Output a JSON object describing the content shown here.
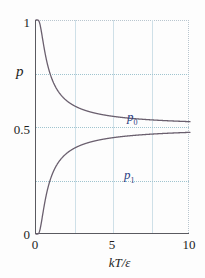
{
  "chart_data": {
    "type": "line",
    "title": "",
    "xlabel": "kT/ε",
    "ylabel": "p",
    "xlim": [
      0,
      10
    ],
    "ylim": [
      0,
      1
    ],
    "xticks": [
      0,
      5,
      10
    ],
    "xtick_labels": [
      "0",
      "5",
      "10"
    ],
    "yticks": [
      0,
      0.5,
      1
    ],
    "ytick_labels": [
      "0",
      "0.5",
      "1"
    ],
    "grid": "dotted horizontal gridlines at 0.25, 0.5, 0.75; solid vertical gridlines at 2.5, 5.0, 7.5",
    "vertical_gridlines": [
      2.5,
      5.0,
      7.5
    ],
    "horizontal_gridlines": [
      0.25,
      0.5,
      0.75
    ],
    "legend_position": "inline-annotations",
    "curve_color": "#6a5f6e",
    "annotation_color": "#2b3f82",
    "gridline_color": "#cfe0e8",
    "axis_color": "#5a5a60",
    "series": [
      {
        "name": "p0",
        "label": "p",
        "label_sub": "0",
        "description": "ground state occupation probability, decays from 1 toward 0.5",
        "x": [
          0.0,
          0.1,
          0.2,
          0.3,
          0.4,
          0.5,
          0.6,
          0.7,
          0.8,
          0.9,
          1.0,
          1.25,
          1.5,
          1.75,
          2.0,
          2.5,
          3.0,
          3.5,
          4.0,
          4.5,
          5.0,
          6.0,
          7.0,
          8.0,
          9.0,
          10.0
        ],
        "values": [
          1.0,
          0.99995,
          0.9933,
          0.9644,
          0.9241,
          0.8808,
          0.839,
          0.8005,
          0.7656,
          0.7343,
          0.7311,
          0.69,
          0.6565,
          0.6301,
          0.6225,
          0.5987,
          0.5826,
          0.5709,
          0.5622,
          0.5553,
          0.5498,
          0.5415,
          0.5356,
          0.5312,
          0.5277,
          0.525
        ]
      },
      {
        "name": "p1",
        "label": "p",
        "label_sub": "1",
        "description": "excited state occupation probability, rises from 0 toward 0.5",
        "x": [
          0.0,
          0.1,
          0.2,
          0.3,
          0.4,
          0.5,
          0.6,
          0.7,
          0.8,
          0.9,
          1.0,
          1.25,
          1.5,
          1.75,
          2.0,
          2.5,
          3.0,
          3.5,
          4.0,
          4.5,
          5.0,
          6.0,
          7.0,
          8.0,
          9.0,
          10.0
        ],
        "values": [
          0.0,
          5e-05,
          0.0067,
          0.0356,
          0.0759,
          0.1192,
          0.161,
          0.1995,
          0.2344,
          0.2657,
          0.2689,
          0.31,
          0.3435,
          0.3699,
          0.3775,
          0.4013,
          0.4174,
          0.4291,
          0.4378,
          0.4447,
          0.4502,
          0.4585,
          0.4644,
          0.4688,
          0.4723,
          0.475
        ]
      }
    ]
  }
}
